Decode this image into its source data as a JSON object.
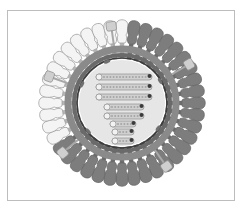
{
  "diagram": {
    "center": [
      122,
      103
    ],
    "colors": {
      "frame": "#bdbdbd",
      "spike_light_fill": "#f4f4f4",
      "spike_light_stroke": "#9a9a9a",
      "spike_dark_fill": "#7d7d7d",
      "knob_fill": "#cfcfcf",
      "membrane_outer": "#8a8a8a",
      "membrane_band": "#6a6a6a",
      "membrane_inner": "#9c9c9c",
      "core_fill": "#e6e6e6",
      "rna_fill": "#d0d0d0",
      "rna_stroke": "#8f8f8f",
      "rna_cap": "#3c3c3c",
      "matrix_dot": "#6f6f6f"
    },
    "envelope": {
      "spike_count": 40,
      "light_spike_start_deg": 180,
      "light_spike_end_deg": 275,
      "knob_angles_deg": [
        262,
        200,
        330,
        140,
        55
      ]
    },
    "core": {
      "radius": 43,
      "rna_segments": [
        {
          "x": 96,
          "y": 77,
          "length": 56
        },
        {
          "x": 96,
          "y": 87,
          "length": 56
        },
        {
          "x": 96,
          "y": 97,
          "length": 56
        },
        {
          "x": 104,
          "y": 107,
          "length": 40
        },
        {
          "x": 104,
          "y": 116,
          "length": 40
        },
        {
          "x": 110,
          "y": 124,
          "length": 26
        },
        {
          "x": 112,
          "y": 132,
          "length": 22
        },
        {
          "x": 112,
          "y": 141,
          "length": 22
        }
      ],
      "matrix_dots_deg": [
        250,
        205,
        140,
        35,
        330
      ]
    }
  }
}
